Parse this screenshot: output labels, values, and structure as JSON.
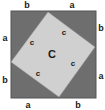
{
  "diagram": {
    "type": "pythagorean-proof",
    "colors": {
      "background": "#ffffff",
      "outer_square": "#6e6e6e",
      "outer_square_border": "#555555",
      "inner_square": "#d0d0d0",
      "text": "#1a1a1a"
    },
    "outer_square": {
      "x": 11,
      "y": 11,
      "width": 85,
      "height": 87
    },
    "inner_square_points": "48,12 95,47 59,97 11,62",
    "labels": {
      "top": [
        "b",
        "a"
      ],
      "right": [
        "b",
        "a"
      ],
      "bottom": [
        "a",
        "b"
      ],
      "left": [
        "a",
        "b"
      ],
      "hypotenuse": [
        "c",
        "c",
        "c",
        "c"
      ],
      "center": "C"
    }
  }
}
